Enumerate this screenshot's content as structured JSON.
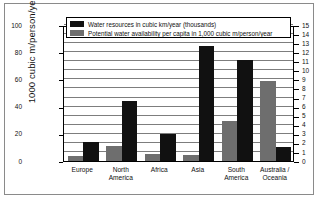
{
  "chart_data": {
    "type": "bar",
    "title": "",
    "subtitle": "",
    "xlabel": "",
    "ylabel": "1000 cubic m/person/year",
    "ylabel_right": "",
    "categories": [
      "Europe",
      "North America",
      "Africa",
      "Asia",
      "South America",
      "Australia / Oceania"
    ],
    "series": [
      {
        "name": "Water resources in cubic km/year (thousands)",
        "color": "#111111",
        "axis": "left",
        "values": [
          14,
          44,
          19.5,
          84.5,
          74,
          10.5
        ]
      },
      {
        "name": "Potential water availability per capita in 1,000 cubic m/person/year",
        "color": "#6e6e6e",
        "axis": "left",
        "values": [
          3.6,
          11,
          5.5,
          4.3,
          29.5,
          59
        ]
      }
    ],
    "ylim": [
      0,
      100
    ],
    "yticks": [
      0,
      20,
      40,
      60,
      80,
      100
    ],
    "ylim_right": [
      0,
      15
    ],
    "yticks_right": [
      0,
      1,
      2,
      3,
      4,
      5,
      6,
      7,
      8,
      9,
      10,
      11,
      12,
      13,
      14,
      15
    ],
    "grid": true,
    "grid_axis": "right",
    "legend_position": "top-center"
  },
  "axis": {
    "left_title": "1000 cubic m/person/year",
    "left_ticks": [
      {
        "label": "100",
        "value": 100
      },
      {
        "label": "80",
        "value": 80
      },
      {
        "label": "60",
        "value": 60
      },
      {
        "label": "40",
        "value": 40
      },
      {
        "label": "20",
        "value": 20
      },
      {
        "label": "0",
        "value": 0
      }
    ],
    "right_ticks": [
      {
        "label": "15",
        "value": 15
      },
      {
        "label": "14",
        "value": 14
      },
      {
        "label": "13",
        "value": 13
      },
      {
        "label": "12",
        "value": 12
      },
      {
        "label": "11",
        "value": 11
      },
      {
        "label": "10",
        "value": 10
      },
      {
        "label": "9",
        "value": 9
      },
      {
        "label": "8",
        "value": 8
      },
      {
        "label": "7",
        "value": 7
      },
      {
        "label": "6",
        "value": 6
      },
      {
        "label": "5",
        "value": 5
      },
      {
        "label": "4",
        "value": 4
      },
      {
        "label": "3",
        "value": 3
      },
      {
        "label": "2",
        "value": 2
      },
      {
        "label": "1",
        "value": 1
      },
      {
        "label": "0",
        "value": 0
      }
    ]
  },
  "categories": [
    {
      "line1": "Europe",
      "line2": ""
    },
    {
      "line1": "North",
      "line2": "America"
    },
    {
      "line1": "Africa",
      "line2": ""
    },
    {
      "line1": "Asia",
      "line2": ""
    },
    {
      "line1": "South",
      "line2": "America"
    },
    {
      "line1": "Australia /",
      "line2": "Oceania"
    }
  ],
  "legend": {
    "items": [
      {
        "label": "Water resources in cubic km/year (thousands)",
        "color": "#111111"
      },
      {
        "label": "Potential water availability per capita in 1,000 cubic m/person/year",
        "color": "#6e6e6e"
      }
    ]
  }
}
